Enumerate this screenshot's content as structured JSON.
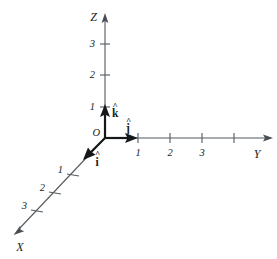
{
  "figure": {
    "background_color": "#ffffff",
    "axis_color": "#555a5e",
    "vector_color": "#15181a",
    "text_color": "#1a1d20"
  },
  "origin": {
    "label": "O",
    "x": 105,
    "y": 138
  },
  "axes": {
    "z": {
      "label": "Z",
      "label_x": 97,
      "label_y": 20,
      "direction": "up",
      "tip_x": 105,
      "tip_y": 14,
      "ticks": [
        {
          "label": "3",
          "x": 105,
          "y": 44,
          "label_x": 95,
          "label_y": 47
        },
        {
          "label": "2",
          "x": 105,
          "y": 75,
          "label_x": 95,
          "label_y": 78
        },
        {
          "label": "1",
          "x": 105,
          "y": 107,
          "label_x": 95,
          "label_y": 110
        }
      ]
    },
    "y": {
      "label": "Y",
      "label_x": 257,
      "label_y": 157,
      "direction": "right",
      "tip_x": 272,
      "tip_y": 138,
      "ticks": [
        {
          "label": "1",
          "x": 138,
          "y": 138,
          "label_x": 136,
          "label_y": 155
        },
        {
          "label": "2",
          "x": 170,
          "y": 138,
          "label_x": 168,
          "label_y": 155
        },
        {
          "label": "3",
          "x": 202,
          "y": 138,
          "label_x": 200,
          "label_y": 155
        },
        {
          "label": "",
          "x": 234,
          "y": 138,
          "label_x": 232,
          "label_y": 155
        }
      ]
    },
    "x": {
      "label": "X",
      "label_x": 19,
      "label_y": 250,
      "direction": "down-left",
      "tip_x": 14,
      "tip_y": 234,
      "ticks": [
        {
          "label": "1",
          "x": 73,
          "y": 175,
          "label_x": 59,
          "label_y": 173
        },
        {
          "label": "2",
          "x": 55,
          "y": 193,
          "label_x": 41,
          "label_y": 191
        },
        {
          "label": "3",
          "x": 37,
          "y": 211,
          "label_x": 23,
          "label_y": 209
        }
      ]
    }
  },
  "unit_vectors": [
    {
      "name": "k-hat",
      "label": "k",
      "accent": "^",
      "axis": "z",
      "from_x": 105,
      "from_y": 138,
      "to_x": 105,
      "to_y": 107,
      "label_x": 112,
      "label_y": 116,
      "hat_x": 113,
      "hat_y": 107
    },
    {
      "name": "j-hat",
      "label": "j",
      "accent": "^",
      "axis": "y",
      "from_x": 105,
      "from_y": 138,
      "to_x": 136,
      "to_y": 138,
      "label_x": 128,
      "label_y": 131,
      "hat_x": 128,
      "hat_y": 122
    },
    {
      "name": "i-hat",
      "label": "i",
      "accent": "^",
      "axis": "x",
      "from_x": 105,
      "from_y": 138,
      "to_x": 85,
      "to_y": 158,
      "label_x": 96,
      "label_y": 164,
      "hat_x": 96,
      "hat_y": 155
    }
  ],
  "tick_marks": {
    "z_half_length": 5,
    "y_half_length": 5,
    "x_half_length": 5
  }
}
